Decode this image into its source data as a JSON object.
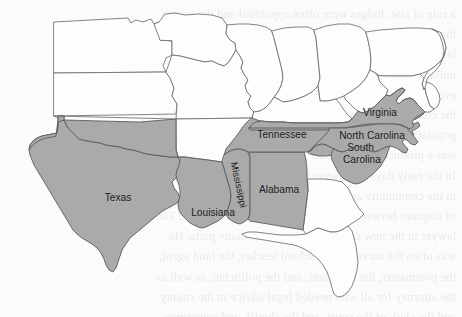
{
  "map": {
    "type": "choropleth-outline-map",
    "region": "Southeastern United States",
    "colors": {
      "shaded_fill": "#aaaaaa",
      "unshaded_fill": "#fdfdfd",
      "border_stroke": "#6e6e72",
      "page_background": "#fbfbfb",
      "label_text": "#17171a"
    },
    "shaded_states": [
      "Texas",
      "Louisiana",
      "Mississippi",
      "Alabama",
      "Tennessee",
      "Virginia",
      "North Carolina",
      "South Carolina"
    ],
    "labels": [
      {
        "id": "texas",
        "text": "Texas",
        "x": 118,
        "y": 198,
        "rotation": 0,
        "lines": [
          "Texas"
        ]
      },
      {
        "id": "louisiana",
        "text": "Louisiana",
        "x": 213,
        "y": 213,
        "rotation": 0,
        "lines": [
          "Louisiana"
        ]
      },
      {
        "id": "mississippi",
        "text": "Mississippi",
        "x": 238,
        "y": 185,
        "rotation": 78,
        "lines": [
          "Mississippi"
        ]
      },
      {
        "id": "alabama",
        "text": "Alabama",
        "x": 279,
        "y": 190,
        "rotation": 0,
        "lines": [
          "Alabama"
        ]
      },
      {
        "id": "tennessee",
        "text": "Tennessee",
        "x": 282,
        "y": 135,
        "rotation": 0,
        "lines": [
          "Tennessee"
        ]
      },
      {
        "id": "virginia",
        "text": "Virginia",
        "x": 380,
        "y": 113,
        "rotation": 0,
        "lines": [
          "Virginia"
        ]
      },
      {
        "id": "north-carolina",
        "text": "North Carolina",
        "x": 372,
        "y": 136,
        "rotation": 0,
        "lines": [
          "North Carolina"
        ]
      },
      {
        "id": "south-carolina",
        "text": "South Carolina",
        "x": 362,
        "y": 155,
        "rotation": 0,
        "lines": [
          "South",
          "Carolina"
        ]
      }
    ]
  },
  "bleed_through_lines": [
    "a rule of law. Judges were often appointed and the court's",
    "the only lawyers in town, knew the law and the customs of",
    "lawyer was so prevalent in the early days in every state of the",
    "union, that the name of lawyer became the name of almost",
    "every man who had a reputation for honesty and integrity.",
    "the courts, their organization and their rapid growth as the",
    "population moved westward. The legal profession in America",
    "was a product of the frontier and its conditions.",
    "In the early days the lawyer was the only man of learning",
    "in the community and he was called upon to settle all sorts",
    "of disputes between neighbors in the new settlements. The",
    "lawyer in the new country was a man of many parts. He",
    "was often the surveyor, the school teacher, the land agent,",
    "the postmaster, the merchant, and the politician, as well as",
    "the attorney for all who needed legal advice in the county.",
    "and the clerk of the court, and the sheriff, and sometimes",
    "he was the banker. In the absence of printed reports and",
    "law books, he carried his library in his saddlebags and his",
    "learning in his head. He rode the circuit with the judge",
    "from county seat to county seat, trying cases in log court",
    "houses, and sleeping in taverns along the way at night, and",
    "argued his cases before juries of farmers and frontiersmen."
  ]
}
